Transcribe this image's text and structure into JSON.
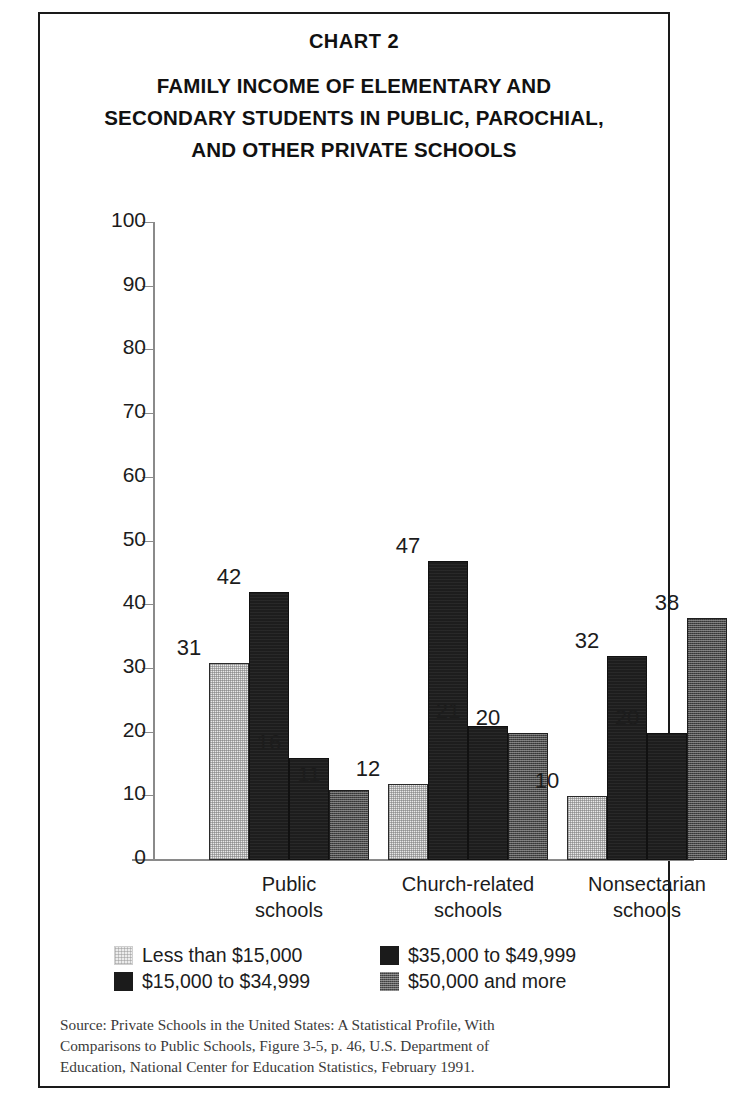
{
  "chart_number": "CHART 2",
  "title_lines": [
    "FAMILY INCOME OF ELEMENTARY AND",
    "SECONDARY STUDENTS IN PUBLIC, PAROCHIAL,",
    "AND OTHER PRIVATE SCHOOLS"
  ],
  "legend": [
    {
      "label": "Less than $15,000",
      "swatch": "light-stipple-swatch"
    },
    {
      "label": "$15,000 to $34,999",
      "swatch": "black-swatch"
    },
    {
      "label": "$35,000 to $49,999",
      "swatch": "black-swatch"
    },
    {
      "label": "$50,000 and more",
      "swatch": "gray-stipple-swatch"
    }
  ],
  "source_lines": [
    "Source: Private Schools in the United States: A Statistical Profile, With",
    "Comparisons to Public Schools, Figure 3-5, p. 46, U.S. Department of",
    "Education, National Center for Education Statistics, February 1991."
  ],
  "chart_data": {
    "type": "bar",
    "title": "FAMILY INCOME OF ELEMENTARY AND SECONDARY STUDENTS IN PUBLIC, PAROCHIAL, AND OTHER PRIVATE SCHOOLS",
    "xlabel": "",
    "ylabel": "",
    "ylim": [
      0,
      100
    ],
    "yticks": [
      0,
      10,
      20,
      30,
      40,
      50,
      60,
      70,
      80,
      90,
      100
    ],
    "grid": false,
    "legend_position": "bottom",
    "categories": [
      "Public schools",
      "Church-related schools",
      "Nonsectarian schools"
    ],
    "category_lines": [
      [
        "Public",
        "schools"
      ],
      [
        "Church-related",
        "schools"
      ],
      [
        "Nonsectarian",
        "schools"
      ]
    ],
    "series": [
      {
        "name": "Less than $15,000",
        "values": [
          31,
          12,
          10
        ]
      },
      {
        "name": "$15,000 to $34,999",
        "values": [
          42,
          47,
          32
        ]
      },
      {
        "name": "$35,000 to $49,999",
        "values": [
          16,
          21,
          20
        ]
      },
      {
        "name": "$50,000 and more",
        "values": [
          11,
          20,
          38
        ]
      }
    ]
  }
}
